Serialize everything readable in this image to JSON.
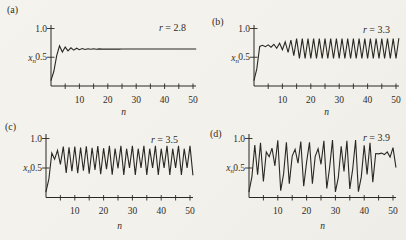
{
  "figure": {
    "background": "#f4f2ed",
    "ink": "#2b2822",
    "description_labels": {
      "panel_a": "(a)",
      "panel_b": "(b)",
      "panel_c": "(c)",
      "panel_d": "(d)"
    }
  },
  "chart_data": [
    {
      "type": "line",
      "panel_label": "(a)",
      "title": "r = 2.8",
      "r": 2.8,
      "x0": 0.1,
      "xlabel": "n",
      "ylabel": "x_n",
      "xlim": [
        0,
        51
      ],
      "ylim": [
        0,
        1.05
      ],
      "grid": false,
      "xticks_labeled": [
        "10",
        "20",
        "30",
        "40",
        "50"
      ],
      "xticks_labeled_values": [
        10,
        20,
        30,
        40,
        50
      ],
      "xticks_minor": [
        5,
        15,
        25,
        35,
        45
      ],
      "yticks": [
        {
          "v": 0.5,
          "label": "0.5"
        },
        {
          "v": 1.0,
          "label": "1.0"
        }
      ],
      "values": [
        0.1,
        0.252,
        0.528,
        0.698,
        0.59,
        0.677,
        0.612,
        0.665,
        0.624,
        0.657,
        0.631,
        0.652,
        0.635,
        0.649,
        0.638,
        0.647,
        0.64,
        0.645,
        0.641,
        0.644,
        0.642,
        0.644,
        0.642,
        0.643,
        0.642,
        0.643,
        0.643,
        0.643,
        0.643,
        0.643,
        0.643,
        0.643,
        0.643,
        0.643,
        0.643,
        0.643,
        0.643,
        0.643,
        0.643,
        0.643,
        0.643,
        0.643,
        0.643,
        0.643,
        0.643,
        0.643,
        0.643,
        0.643,
        0.643,
        0.643,
        0.643,
        0.643
      ]
    },
    {
      "type": "line",
      "panel_label": "(b)",
      "title": "r = 3.3",
      "r": 3.3,
      "x0": 0.1,
      "xlabel": "n",
      "ylabel": "x_n",
      "xlim": [
        0,
        51
      ],
      "ylim": [
        0,
        1.05
      ],
      "grid": false,
      "xticks_labeled": [
        "10",
        "20",
        "30",
        "40",
        "50"
      ],
      "xticks_labeled_values": [
        10,
        20,
        30,
        40,
        50
      ],
      "xticks_minor": [
        5,
        15,
        25,
        35,
        45
      ],
      "yticks": [
        {
          "v": 0.5,
          "label": "0.5"
        },
        {
          "v": 1.0,
          "label": "1.0"
        }
      ],
      "values": [
        0.1,
        0.297,
        0.689,
        0.707,
        0.684,
        0.714,
        0.674,
        0.725,
        0.658,
        0.743,
        0.63,
        0.769,
        0.586,
        0.8,
        0.527,
        0.823,
        0.482,
        0.824,
        0.479,
        0.823,
        0.48,
        0.824,
        0.479,
        0.824,
        0.479,
        0.824,
        0.479,
        0.824,
        0.479,
        0.824,
        0.479,
        0.824,
        0.479,
        0.824,
        0.479,
        0.824,
        0.479,
        0.824,
        0.479,
        0.824,
        0.479,
        0.824,
        0.479,
        0.824,
        0.479,
        0.824,
        0.479,
        0.824,
        0.479,
        0.824,
        0.479,
        0.824
      ]
    },
    {
      "type": "line",
      "panel_label": "(c)",
      "title": "r = 3.5",
      "r": 3.5,
      "x0": 0.1,
      "xlabel": "n",
      "ylabel": "x_n",
      "xlim": [
        0,
        51
      ],
      "ylim": [
        0,
        1.05
      ],
      "grid": false,
      "xticks_labeled": [
        "10",
        "20",
        "30",
        "40",
        "50"
      ],
      "xticks_labeled_values": [
        10,
        20,
        30,
        40,
        50
      ],
      "xticks_minor": [
        5,
        15,
        25,
        35,
        45
      ],
      "yticks": [
        {
          "v": 0.5,
          "label": "0.5"
        },
        {
          "v": 1.0,
          "label": "1.0"
        }
      ],
      "values": [
        0.1,
        0.315,
        0.755,
        0.647,
        0.799,
        0.561,
        0.862,
        0.417,
        0.851,
        0.444,
        0.864,
        0.411,
        0.847,
        0.453,
        0.867,
        0.403,
        0.842,
        0.466,
        0.871,
        0.394,
        0.835,
        0.481,
        0.874,
        0.386,
        0.83,
        0.495,
        0.875,
        0.383,
        0.827,
        0.501,
        0.875,
        0.383,
        0.827,
        0.501,
        0.875,
        0.383,
        0.827,
        0.501,
        0.875,
        0.383,
        0.827,
        0.501,
        0.875,
        0.383,
        0.827,
        0.501,
        0.875,
        0.383,
        0.827,
        0.501,
        0.875,
        0.383
      ]
    },
    {
      "type": "line",
      "panel_label": "(d)",
      "title": "r = 3.9",
      "r": 3.9,
      "x0": 0.1,
      "xlabel": "n",
      "ylabel": "x_n",
      "xlim": [
        0,
        51
      ],
      "ylim": [
        0,
        1.05
      ],
      "grid": false,
      "xticks_labeled": [
        "10",
        "20",
        "30",
        "40",
        "50"
      ],
      "xticks_labeled_values": [
        10,
        20,
        30,
        40,
        50
      ],
      "xticks_minor": [
        5,
        15,
        25,
        35,
        45
      ],
      "yticks": [
        {
          "v": 0.5,
          "label": "0.5"
        },
        {
          "v": 1.0,
          "label": "1.0"
        }
      ],
      "values": [
        0.1,
        0.351,
        0.888,
        0.387,
        0.925,
        0.271,
        0.771,
        0.69,
        0.835,
        0.538,
        0.969,
        0.116,
        0.4,
        0.936,
        0.235,
        0.701,
        0.817,
        0.582,
        0.949,
        0.19,
        0.6,
        0.936,
        0.233,
        0.696,
        0.825,
        0.563,
        0.959,
        0.152,
        0.503,
        0.975,
        0.095,
        0.336,
        0.87,
        0.441,
        0.961,
        0.145,
        0.482,
        0.974,
        0.1,
        0.35,
        0.887,
        0.391,
        0.929,
        0.258,
        0.746,
        0.739,
        0.752,
        0.727,
        0.773,
        0.684,
        0.844,
        0.513
      ]
    }
  ]
}
